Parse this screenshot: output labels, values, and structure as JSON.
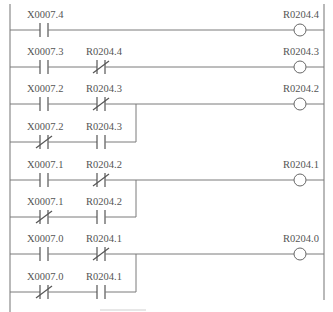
{
  "diagram": {
    "type": "ladder-logic",
    "rungs": [
      {
        "output": "R0204.4",
        "main": [
          {
            "addr": "X0007.4",
            "type": "NO"
          }
        ],
        "branch": []
      },
      {
        "output": "R0204.3",
        "main": [
          {
            "addr": "X0007.3",
            "type": "NO"
          },
          {
            "addr": "R0204.4",
            "type": "NC"
          }
        ],
        "branch": []
      },
      {
        "output": "R0204.2",
        "main": [
          {
            "addr": "X0007.2",
            "type": "NO"
          },
          {
            "addr": "R0204.3",
            "type": "NC"
          }
        ],
        "branch": [
          {
            "addr": "X0007.2",
            "type": "NC"
          },
          {
            "addr": "R0204.3",
            "type": "NO"
          }
        ]
      },
      {
        "output": "R0204.1",
        "main": [
          {
            "addr": "X0007.1",
            "type": "NO"
          },
          {
            "addr": "R0204.2",
            "type": "NC"
          }
        ],
        "branch": [
          {
            "addr": "X0007.1",
            "type": "NC"
          },
          {
            "addr": "R0204.2",
            "type": "NO"
          }
        ]
      },
      {
        "output": "R0204.0",
        "main": [
          {
            "addr": "X0007.0",
            "type": "NO"
          },
          {
            "addr": "R0204.1",
            "type": "NC"
          }
        ],
        "branch": [
          {
            "addr": "X0007.0",
            "type": "NC"
          },
          {
            "addr": "R0204.1",
            "type": "NO"
          }
        ]
      }
    ]
  },
  "labels": {
    "r1_c1": "X0007.4",
    "r1_out": "R0204.4",
    "r2_c1": "X0007.3",
    "r2_c2": "R0204.4",
    "r2_out": "R0204.3",
    "r3_c1": "X0007.2",
    "r3_c2": "R0204.3",
    "r3_b1": "X0007.2",
    "r3_b2": "R0204.3",
    "r3_out": "R0204.2",
    "r4_c1": "X0007.1",
    "r4_c2": "R0204.2",
    "r4_b1": "X0007.1",
    "r4_b2": "R0204.2",
    "r4_out": "R0204.1",
    "r5_c1": "X0007.0",
    "r5_c2": "R0204.1",
    "r5_b1": "X0007.0",
    "r5_b2": "R0204.1",
    "r5_out": "R0204.0"
  }
}
